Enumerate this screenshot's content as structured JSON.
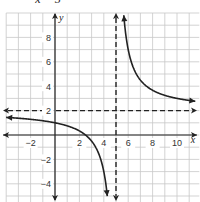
{
  "chart_data": {
    "type": "line",
    "title": "x = 5",
    "xlabel": "x",
    "ylabel": "y",
    "xlim": [
      -4,
      11.5
    ],
    "ylim": [
      -5.3,
      10
    ],
    "grid": true,
    "grid_step": 1,
    "x_ticks": [
      {
        "value": -2,
        "label": "−2"
      },
      {
        "value": 2,
        "label": "2"
      },
      {
        "value": 4,
        "label": "4"
      },
      {
        "value": 6,
        "label": "6"
      },
      {
        "value": 8,
        "label": "8"
      },
      {
        "value": 10,
        "label": "10"
      }
    ],
    "y_ticks": [
      {
        "value": 8,
        "label": "8"
      },
      {
        "value": 6,
        "label": "6"
      },
      {
        "value": 4,
        "label": "4"
      },
      {
        "value": 2,
        "label": "2"
      },
      {
        "value": -2,
        "label": "−2"
      },
      {
        "value": -4,
        "label": "−4"
      }
    ],
    "function": {
      "form": "y = a/(x - h) + k",
      "a": 5,
      "h": 5,
      "k": 2
    },
    "asymptotes": {
      "vertical": 5,
      "horizontal": 2
    },
    "series": [
      {
        "name": "left branch",
        "x_range": [
          -4,
          4.5
        ]
      },
      {
        "name": "right branch",
        "x_range": [
          5.52,
          11.5
        ]
      }
    ],
    "colors": {
      "grid": "#c8c8c8",
      "axis": "#222222",
      "curve": "#222222"
    }
  }
}
